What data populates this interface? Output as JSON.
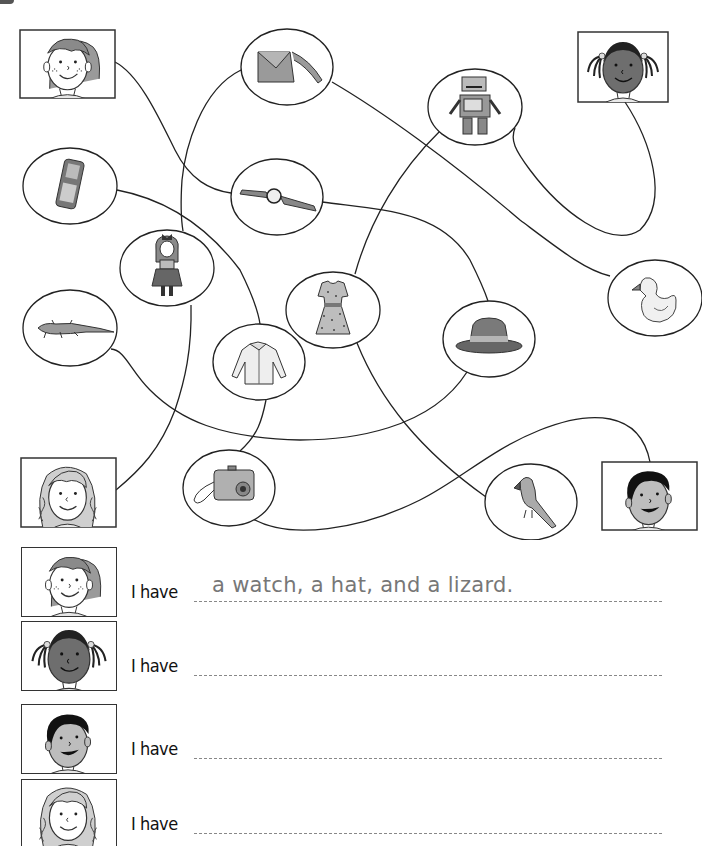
{
  "worksheet": {
    "title": "",
    "puzzle": {
      "faces": [
        {
          "id": "boy-freckles",
          "description": "boy with freckles",
          "box": [
            20,
            30,
            95,
            68
          ]
        },
        {
          "id": "girl-pigtails",
          "description": "girl with dark skin and pigtails",
          "box": [
            578,
            32,
            90,
            70
          ]
        },
        {
          "id": "girl-curly",
          "description": "girl with curly hair",
          "box": [
            21,
            458,
            95,
            69
          ]
        },
        {
          "id": "boy-dark-hair",
          "description": "boy with dark hair",
          "box": [
            602,
            462,
            95,
            68
          ]
        }
      ],
      "items": [
        {
          "id": "bag",
          "label": "bag",
          "cx": 287,
          "cy": 67,
          "rx": 46,
          "ry": 38
        },
        {
          "id": "robot",
          "label": "robot",
          "cx": 475,
          "cy": 107,
          "rx": 47,
          "ry": 38
        },
        {
          "id": "phone",
          "label": "mobile phone",
          "cx": 70,
          "cy": 186,
          "rx": 47,
          "ry": 38
        },
        {
          "id": "watch",
          "label": "watch",
          "cx": 277,
          "cy": 197,
          "rx": 46,
          "ry": 38
        },
        {
          "id": "doll",
          "label": "doll",
          "cx": 167,
          "cy": 268,
          "rx": 47,
          "ry": 38
        },
        {
          "id": "dress",
          "label": "dress",
          "cx": 333,
          "cy": 310,
          "rx": 47,
          "ry": 38
        },
        {
          "id": "hat",
          "label": "hat",
          "cx": 489,
          "cy": 339,
          "rx": 46,
          "ry": 38
        },
        {
          "id": "duck",
          "label": "rubber duck",
          "cx": 655,
          "cy": 298,
          "rx": 47,
          "ry": 38
        },
        {
          "id": "lizard",
          "label": "lizard",
          "cx": 70,
          "cy": 328,
          "rx": 47,
          "ry": 38
        },
        {
          "id": "shirt",
          "label": "shirt",
          "cx": 259,
          "cy": 362,
          "rx": 46,
          "ry": 38
        },
        {
          "id": "camera",
          "label": "camera",
          "cx": 229,
          "cy": 488,
          "rx": 46,
          "ry": 38
        },
        {
          "id": "parrot",
          "label": "parrot",
          "cx": 531,
          "cy": 502,
          "rx": 46,
          "ry": 38
        }
      ]
    },
    "answers": [
      {
        "face": "boy-freckles",
        "label": "I have",
        "text": "a watch, a hat, and a lizard."
      },
      {
        "face": "girl-pigtails",
        "label": "I have",
        "text": ""
      },
      {
        "face": "boy-dark-hair",
        "label": "I have",
        "text": ""
      },
      {
        "face": "girl-curly",
        "label": "I have",
        "text": ""
      }
    ],
    "colors": {
      "line": "#222222",
      "answer_text": "#777777",
      "dark_skin": "#6e6e6e",
      "light_skin": "#ffffff",
      "grey_skin": "#bdbdbd"
    }
  }
}
